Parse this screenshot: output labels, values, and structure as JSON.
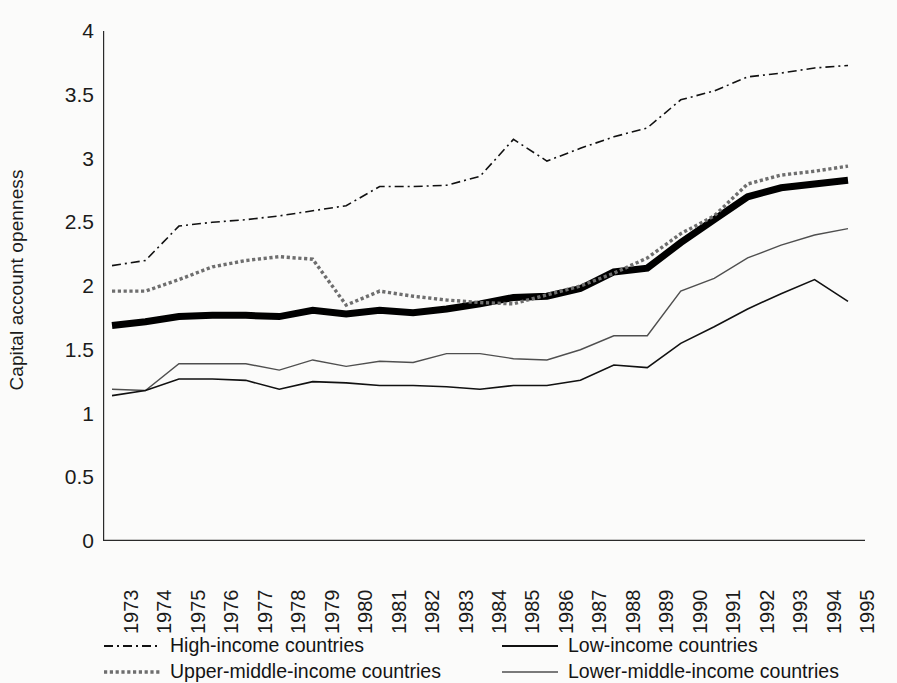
{
  "chart_data": {
    "type": "line",
    "title": "",
    "xlabel": "",
    "ylabel": "Capital account openness",
    "ylim": [
      0,
      4
    ],
    "ytick_labels": [
      "0",
      "0.5",
      "1",
      "1.5",
      "2",
      "2.5",
      "3",
      "3.5",
      "4"
    ],
    "ytick_values": [
      0,
      0.5,
      1,
      1.5,
      2,
      2.5,
      3,
      3.5,
      4
    ],
    "grid": false,
    "legend_position": "below-plot",
    "x": [
      1973,
      1974,
      1975,
      1976,
      1977,
      1978,
      1979,
      1980,
      1981,
      1982,
      1983,
      1984,
      1985,
      1986,
      1987,
      1988,
      1989,
      1990,
      1991,
      1992,
      1993,
      1994,
      1995
    ],
    "categories": [
      "1973",
      "1974",
      "1975",
      "1976",
      "1977",
      "1978",
      "1979",
      "1980",
      "1981",
      "1982",
      "1983",
      "1984",
      "1985",
      "1986",
      "1987",
      "1988",
      "1989",
      "1990",
      "1991",
      "1992",
      "1993",
      "1994",
      "1995"
    ],
    "series": [
      {
        "name": "High-income countries",
        "style": "dash-dot",
        "width": 1.6,
        "color": "#111111",
        "values": [
          2.16,
          2.2,
          2.47,
          2.5,
          2.52,
          2.55,
          2.59,
          2.63,
          2.78,
          2.78,
          2.79,
          2.86,
          3.15,
          2.98,
          3.08,
          3.17,
          3.24,
          3.46,
          3.53,
          3.64,
          3.67,
          3.71,
          3.73
        ]
      },
      {
        "name": "Upper-middle-income countries",
        "style": "dotted",
        "width": 3.4,
        "color": "#6e6e6e",
        "values": [
          1.96,
          1.96,
          2.05,
          2.15,
          2.2,
          2.23,
          2.21,
          1.85,
          1.96,
          1.92,
          1.89,
          1.87,
          1.86,
          1.93,
          2.0,
          2.1,
          2.22,
          2.41,
          2.55,
          2.8,
          2.87,
          2.9,
          2.94
        ]
      },
      {
        "name": "Low-income countries",
        "style": "solid",
        "width": 1.6,
        "color": "#111111",
        "values": [
          1.14,
          1.18,
          1.27,
          1.27,
          1.26,
          1.19,
          1.25,
          1.24,
          1.22,
          1.22,
          1.21,
          1.19,
          1.22,
          1.22,
          1.26,
          1.38,
          1.36,
          1.55,
          1.68,
          1.82,
          1.94,
          2.05,
          1.88
        ]
      },
      {
        "name": "Lower-middle-income countries",
        "style": "solid",
        "width": 1.4,
        "color": "#4f4f4f",
        "values": [
          1.19,
          1.18,
          1.39,
          1.39,
          1.39,
          1.34,
          1.42,
          1.37,
          1.41,
          1.4,
          1.47,
          1.47,
          1.43,
          1.42,
          1.5,
          1.61,
          1.61,
          1.96,
          2.06,
          2.22,
          2.32,
          2.4,
          2.45
        ]
      },
      {
        "name": "Total",
        "style": "thick-solid",
        "width": 7.0,
        "color": "#000000",
        "values": [
          1.69,
          1.72,
          1.76,
          1.77,
          1.77,
          1.76,
          1.81,
          1.78,
          1.81,
          1.79,
          1.82,
          1.86,
          1.91,
          1.92,
          1.98,
          2.11,
          2.14,
          2.34,
          2.52,
          2.7,
          2.77,
          2.8,
          2.83
        ]
      }
    ],
    "legend": [
      {
        "label": "High-income countries",
        "style": "dash-dot",
        "col": 0,
        "row": 0
      },
      {
        "label": "Upper-middle-income countries",
        "style": "dotted",
        "col": 0,
        "row": 1
      },
      {
        "label": "Low-income countries",
        "style": "solid",
        "col": 1,
        "row": 0
      },
      {
        "label": "Lower-middle-income countries",
        "style": "solid-gray",
        "col": 1,
        "row": 1
      }
    ]
  }
}
